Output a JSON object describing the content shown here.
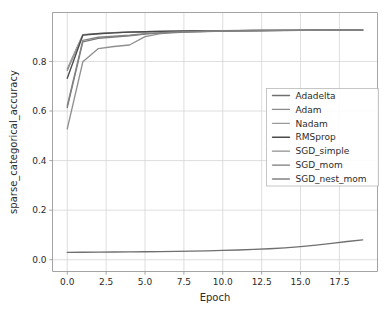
{
  "chart_data": {
    "type": "line",
    "title": "",
    "xlabel": "Epoch",
    "ylabel": "sparse_categorical_accuracy",
    "xlim": [
      -0.95,
      19.95
    ],
    "ylim": [
      -0.0475,
      0.9975
    ],
    "xticks": [
      "0.0",
      "2.5",
      "5.0",
      "7.5",
      "10.0",
      "12.5",
      "15.0",
      "17.5"
    ],
    "xtick_values": [
      0.0,
      2.5,
      5.0,
      7.5,
      10.0,
      12.5,
      15.0,
      17.5
    ],
    "yticks": [
      "0.0",
      "0.2",
      "0.4",
      "0.6",
      "0.8"
    ],
    "ytick_values": [
      0.0,
      0.2,
      0.4,
      0.6,
      0.8
    ],
    "grid": true,
    "legend_position": "center right",
    "x": [
      0,
      1,
      2,
      3,
      4,
      5,
      6,
      7,
      8,
      9,
      10,
      11,
      12,
      13,
      14,
      15,
      16,
      17,
      18,
      19
    ],
    "series": [
      {
        "name": "Adadelta",
        "color": "#6f6f6f",
        "values": [
          0.0295,
          0.03,
          0.0305,
          0.031,
          0.0316,
          0.0322,
          0.033,
          0.0338,
          0.0348,
          0.036,
          0.0375,
          0.0393,
          0.0415,
          0.0443,
          0.048,
          0.0528,
          0.0588,
          0.066,
          0.0735,
          0.08
        ]
      },
      {
        "name": "Adam",
        "color": "#8a8a8a",
        "values": [
          0.764,
          0.907,
          0.9125,
          0.916,
          0.9185,
          0.92,
          0.9215,
          0.9225,
          0.923,
          0.9238,
          0.9242,
          0.9246,
          0.925,
          0.9253,
          0.9256,
          0.9258,
          0.926,
          0.9262,
          0.9264,
          0.9266
        ]
      },
      {
        "name": "Nadam",
        "color": "#9a9a9a",
        "values": [
          0.77,
          0.9085,
          0.913,
          0.9165,
          0.9188,
          0.9202,
          0.9216,
          0.9226,
          0.9232,
          0.9239,
          0.9243,
          0.9247,
          0.9251,
          0.9254,
          0.9257,
          0.9259,
          0.9261,
          0.9263,
          0.9265,
          0.9267
        ]
      },
      {
        "name": "RMSprop",
        "color": "#4a4a4a",
        "values": [
          0.732,
          0.906,
          0.9118,
          0.9155,
          0.918,
          0.9197,
          0.9212,
          0.9222,
          0.9229,
          0.9236,
          0.9241,
          0.9245,
          0.9249,
          0.9252,
          0.9255,
          0.9257,
          0.9259,
          0.9261,
          0.9263,
          0.9265
        ]
      },
      {
        "name": "SGD_simple",
        "color": "#8f8f8f",
        "values": [
          0.528,
          0.7985,
          0.852,
          0.8605,
          0.8665,
          0.9005,
          0.912,
          0.9165,
          0.9192,
          0.921,
          0.9222,
          0.9232,
          0.924,
          0.9246,
          0.925,
          0.9254,
          0.9257,
          0.926,
          0.9262,
          0.9264
        ]
      },
      {
        "name": "SGD_mom",
        "color": "#787878",
        "values": [
          0.614,
          0.879,
          0.893,
          0.8985,
          0.903,
          0.9105,
          0.915,
          0.918,
          0.92,
          0.9215,
          0.9226,
          0.9234,
          0.9241,
          0.9246,
          0.9251,
          0.9254,
          0.9257,
          0.926,
          0.9262,
          0.9264
        ]
      },
      {
        "name": "SGD_nest_mom",
        "color": "#838383",
        "values": [
          0.622,
          0.885,
          0.8975,
          0.902,
          0.9058,
          0.912,
          0.9158,
          0.9185,
          0.9203,
          0.9217,
          0.9228,
          0.9236,
          0.9242,
          0.9247,
          0.9251,
          0.9255,
          0.9258,
          0.926,
          0.9263,
          0.9265
        ]
      }
    ]
  },
  "legend": {
    "entries": [
      {
        "label": "Adadelta"
      },
      {
        "label": "Adam"
      },
      {
        "label": "Nadam"
      },
      {
        "label": "RMSprop"
      },
      {
        "label": "SGD_simple"
      },
      {
        "label": "SGD_mom"
      },
      {
        "label": "SGD_nest_mom"
      }
    ]
  },
  "style": {
    "background": "#ffffff",
    "grid_color": "#d6d6d6",
    "axis_color": "#9a9a9a",
    "text_color": "#2b2b2b",
    "legend_border": "#b8b8b8"
  }
}
